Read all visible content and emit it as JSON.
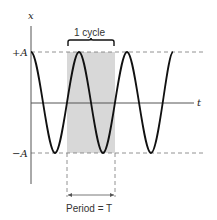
{
  "diagram": {
    "type": "oscillation",
    "axes": {
      "y_label": "x",
      "x_label": "t",
      "pos_amplitude_label": "+A",
      "neg_amplitude_label": "−A"
    },
    "annotations": {
      "cycle_label": "1 cycle",
      "period_label": "Period = T"
    },
    "colors": {
      "curve": "#111111",
      "axis": "#555555",
      "dashed": "#777777",
      "shade": "#d8d8d8"
    }
  }
}
